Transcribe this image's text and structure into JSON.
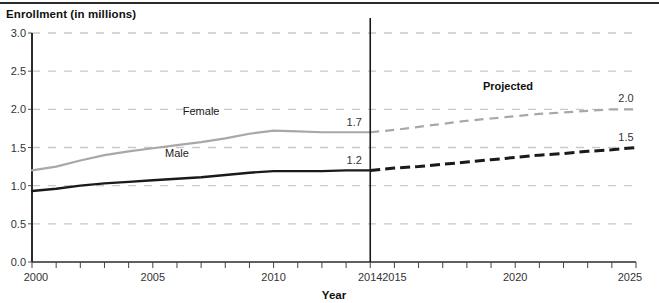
{
  "chart_data": {
    "type": "line",
    "title": "Enrollment (in millions)",
    "xlabel": "Year",
    "ylabel": "Enrollment (in millions)",
    "xlim": [
      2000,
      2025
    ],
    "ylim": [
      0.0,
      3.0
    ],
    "grid": true,
    "legend_position": "inline",
    "ytick_labels": [
      "0.0",
      "0.5",
      "1.0",
      "1.5",
      "2.0",
      "2.5",
      "3.0"
    ],
    "ytick_values": [
      0.0,
      0.5,
      1.0,
      1.5,
      2.0,
      2.5,
      3.0
    ],
    "xtick_labels": [
      "2000",
      "2005",
      "2010",
      "2014",
      "2015",
      "2020",
      "2025"
    ],
    "xtick_values": [
      2000,
      2005,
      2010,
      2014,
      2015,
      2020,
      2025
    ],
    "x": [
      2000,
      2001,
      2002,
      2003,
      2004,
      2005,
      2006,
      2007,
      2008,
      2009,
      2010,
      2011,
      2012,
      2013,
      2014,
      2015,
      2016,
      2017,
      2018,
      2019,
      2020,
      2021,
      2022,
      2023,
      2024,
      2025
    ],
    "series": [
      {
        "name": "Female",
        "color": "#a8a8a8",
        "label_x": 2007,
        "label_y": 1.93,
        "actual_values": [
          1.2,
          1.25,
          1.33,
          1.4,
          1.45,
          1.49,
          1.53,
          1.57,
          1.62,
          1.68,
          1.72,
          1.71,
          1.7,
          1.7,
          1.7
        ],
        "projected_values": [
          1.7,
          1.73,
          1.77,
          1.81,
          1.85,
          1.88,
          1.91,
          1.94,
          1.96,
          1.98,
          2.0,
          2.0
        ],
        "start_label": "1.7",
        "end_label": "2.0"
      },
      {
        "name": "Male",
        "color": "#1a1a1a",
        "label_x": 2006,
        "label_y": 1.37,
        "actual_values": [
          0.93,
          0.96,
          1.0,
          1.03,
          1.05,
          1.07,
          1.09,
          1.11,
          1.14,
          1.17,
          1.19,
          1.19,
          1.19,
          1.2,
          1.2
        ],
        "projected_values": [
          1.2,
          1.23,
          1.25,
          1.28,
          1.31,
          1.34,
          1.37,
          1.4,
          1.42,
          1.45,
          1.47,
          1.5
        ],
        "start_label": "1.2",
        "end_label": "1.5"
      }
    ],
    "annotations": {
      "projected": "Projected",
      "projected_x": 2019.7,
      "projected_y": 2.25,
      "divider_year": 2014
    }
  }
}
